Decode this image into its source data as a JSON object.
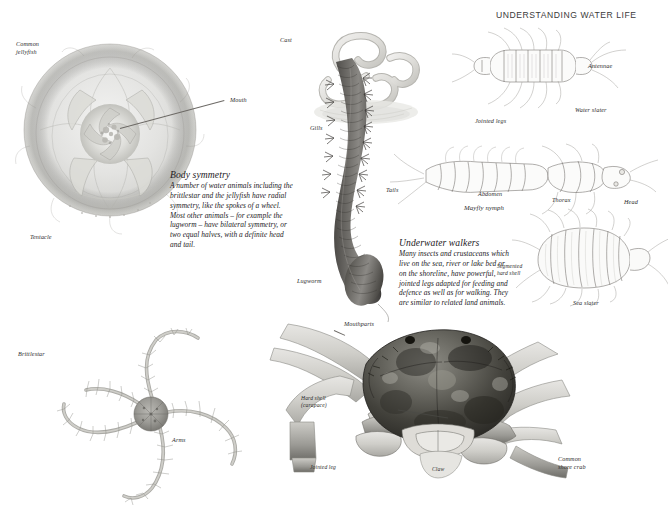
{
  "header": {
    "title": "UNDERSTANDING WATER LIFE"
  },
  "text_blocks": [
    {
      "id": "body-symmetry",
      "heading": "Body symmetry",
      "body": "A number of water animals including the brittlestar and the jellyfish have radial symmetry, like the spokes of a wheel. Most other animals – for example the lugworm – have bilateral symmetry, or two equal halves, with a definite head and tail."
    },
    {
      "id": "underwater-walkers",
      "heading": "Underwater walkers",
      "body": "Many insects and crustaceans which live on the sea, river or lake bed or on the shoreline, have powerful, jointed legs adapted for feeding and defence as well as for walking. They are similar to related land animals."
    }
  ],
  "labels": {
    "common_jellyfish": "Common\njellyfish",
    "mouth": "Mouth",
    "tentacle": "Tentacle",
    "brittlestar": "Brittlestar",
    "arms": "Arms",
    "cast": "Cast",
    "gills": "Gills",
    "lugworm": "Lugworm",
    "tails": "Tails",
    "mouthparts": "Mouthparts",
    "antennae": "Antennae",
    "water_slater": "Water slater",
    "jointed_legs": "Jointed legs",
    "abdomen": "Abdomen",
    "mayfly_nymph": "Mayfly nymph",
    "thorax": "Thorax",
    "head": "Head",
    "segmented_hard_shell": "Segmented\nhard shell",
    "sea_slater": "Sea slater",
    "hard_shell_carapace": "Hard shell\n(carapace)",
    "jointed_leg": "Jointed leg",
    "claw": "Claw",
    "common_shore_crab": "Common\nshore crab"
  },
  "figures": {
    "jellyfish": "common-jellyfish-illustration",
    "brittlestar": "brittlestar-illustration",
    "lugworm": "lugworm-illustration",
    "lugworm_cast": "lugworm-cast-illustration",
    "water_slater": "water-slater-illustration",
    "mayfly_nymph": "mayfly-nymph-illustration",
    "sea_slater": "sea-slater-illustration",
    "shore_crab": "common-shore-crab-illustration"
  },
  "colors": {
    "page_background": "#ffffff",
    "ink": "#6f6c68",
    "text": "#23201d",
    "label_text": "#2b2b2b",
    "header_text": "#3a3a3a",
    "leader_line": "#6d6a66"
  }
}
